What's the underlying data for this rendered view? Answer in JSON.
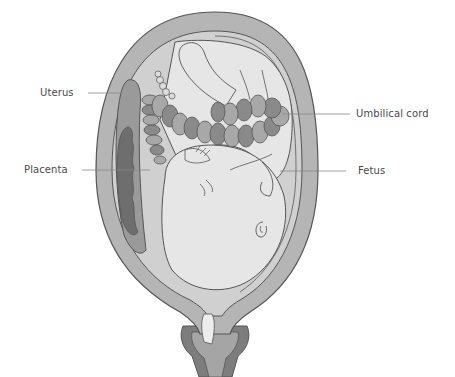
{
  "diagram": {
    "title": "",
    "labels": [
      {
        "id": "uterus",
        "text": "Uterus"
      },
      {
        "id": "placenta",
        "text": "Placenta"
      },
      {
        "id": "umbilical-cord",
        "text": "Umbilical cord"
      },
      {
        "id": "fetus",
        "text": "Fetus"
      }
    ]
  },
  "colors": {
    "uterus_wall": "#b5b5b5",
    "uterus_outline": "#555555",
    "amniotic": "#d0d0d0",
    "fetus": "#e6e6e6",
    "placenta_outer": "#9a9a9a",
    "placenta_inner": "#6e6e6e",
    "cord_light": "#a8a8a8",
    "cord_dark": "#8a8a8a",
    "cervix_plug": "#ededed",
    "vagina_dark": "#7d7d7d",
    "leader_line": "#888888",
    "label_text": "#4a4a4a"
  }
}
